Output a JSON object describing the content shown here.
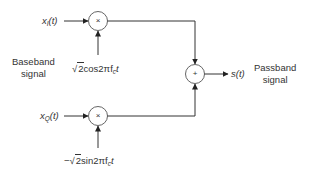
{
  "diagram": {
    "type": "IQ modulator block diagram",
    "inputs": {
      "in_phase": {
        "symbol": "x",
        "subscript": "I",
        "arg": "(t)"
      },
      "quadrature": {
        "symbol": "x",
        "subscript": "Q",
        "arg": "(t)"
      }
    },
    "carriers": {
      "cos": {
        "prefix": "",
        "radical": "2",
        "rest": "cos2πf",
        "subscript": "c",
        "suffix": "t"
      },
      "sin": {
        "prefix": "−",
        "radical": "2",
        "rest": "sin2πf",
        "subscript": "c",
        "suffix": "t"
      }
    },
    "operators": {
      "multiplier_top": "×",
      "multiplier_bottom": "×",
      "adder": "+"
    },
    "output": {
      "symbol": "s(t)"
    },
    "labels": {
      "baseband_line1": "Baseband",
      "baseband_line2": "signal",
      "passband_line1": "Passband",
      "passband_line2": "signal"
    },
    "colors": {
      "line": "#333333",
      "text": "#333333",
      "background": "#ffffff"
    }
  }
}
